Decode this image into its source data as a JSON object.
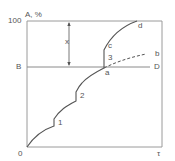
{
  "diagram": {
    "y_axis_label": "A, %",
    "y_tick_100": "100",
    "y_label_B": "B",
    "origin_label": "0",
    "x_axis_label": "τ",
    "horizontal_line_end_label": "D",
    "gap_label": "x",
    "step_labels": [
      "1",
      "2",
      "3"
    ],
    "point_labels": {
      "a": "a",
      "b": "b",
      "c": "c",
      "d": "d"
    },
    "colors": {
      "axis": "#9a9a9a",
      "curve": "#555555",
      "text": "#555555"
    }
  }
}
